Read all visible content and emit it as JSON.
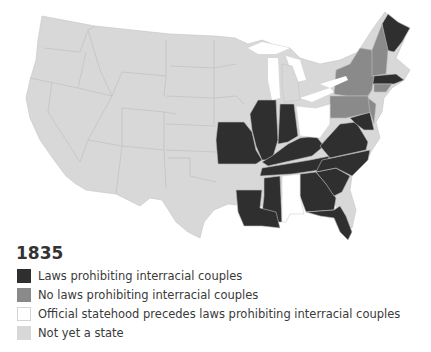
{
  "title": "1835",
  "legend": [
    {
      "label": "Laws prohibiting interracial couples",
      "color": "#2f2f2f"
    },
    {
      "label": "No laws prohibiting interracial couples",
      "color": "#8a8a8a"
    },
    {
      "label": "Official statehood precedes laws prohibiting interracial couples",
      "color": "#ffffff"
    },
    {
      "label": "Not yet a state",
      "color": "#d8d8d8"
    }
  ],
  "colors": {
    "laws": "#2f2f2f",
    "no_laws": "#8a8a8a",
    "statehood_precedes": "#ffffff",
    "not_state": "#d8d8d8",
    "border": "#bdbdbd"
  }
}
